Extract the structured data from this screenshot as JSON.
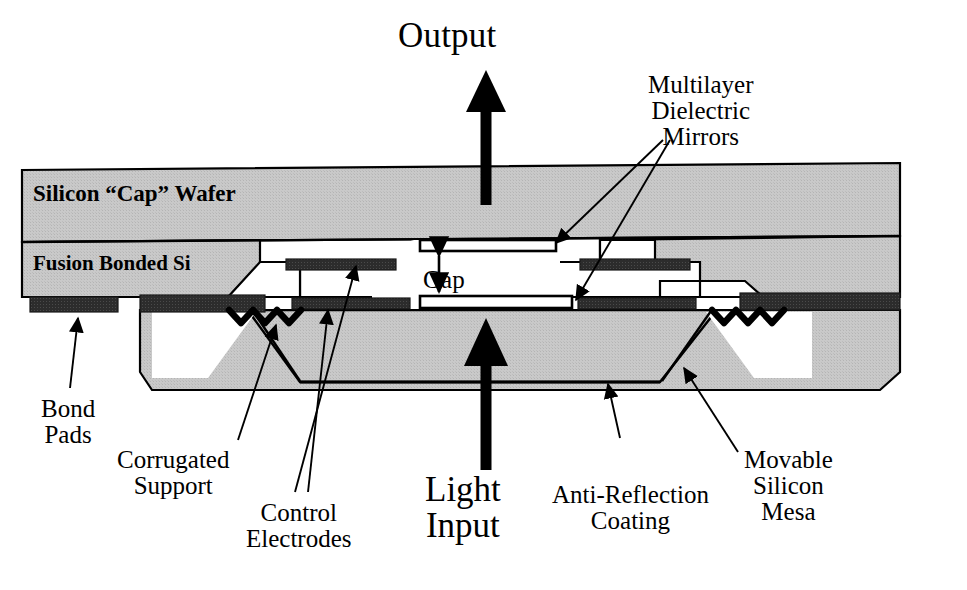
{
  "figure": {
    "type": "technical-cross-section-diagram"
  },
  "colors": {
    "background": "#ffffff",
    "silicon_fill": "#c6c6c6",
    "electrode_fill": "#2a2a2a",
    "outline": "#000000",
    "mirror_fill": "#ffffff",
    "text": "#000000"
  },
  "labels": {
    "output": "Output",
    "multilayer_dielectric_mirrors": "Multilayer\nDielectric\nMirrors",
    "silicon_cap_wafer": "Silicon “Cap” Wafer",
    "fusion_bonded_si": "Fusion Bonded Si",
    "gap": "Gap",
    "bond_pads": "Bond\nPads",
    "corrugated_support": "Corrugated\nSupport",
    "control_electrodes": "Control\nElectrodes",
    "light_input": "Light\nInput",
    "anti_reflection_coating": "Anti-Reflection\nCoating",
    "movable_silicon_mesa": "Movable\nSilicon\nMesa"
  },
  "regions": [
    {
      "name": "silicon-cap-wafer",
      "description": "Upper hatched silicon slab spanning full width"
    },
    {
      "name": "fusion-bonded-si",
      "description": "Second hatched silicon layer below cap wafer"
    },
    {
      "name": "movable-silicon-mesa",
      "description": "Central trapezoidal movable silicon mesa"
    },
    {
      "name": "bond-pads",
      "description": "Dark metal pads on the underside at the left edge"
    },
    {
      "name": "control-electrodes",
      "description": "Dark metal electrode stripes facing the actuation gap"
    },
    {
      "name": "corrugated-support",
      "description": "Zigzag corrugated flexure springs on both sides of the mesa"
    },
    {
      "name": "top-mirror",
      "description": "Upper multilayer dielectric mirror above the gap"
    },
    {
      "name": "bottom-mirror",
      "description": "Lower multilayer dielectric mirror below the gap"
    },
    {
      "name": "anti-reflection-coating",
      "description": "Coating on the lower surface of the mesa"
    }
  ],
  "arrows": [
    {
      "name": "output-beam-arrow",
      "direction": "up",
      "label": "Output"
    },
    {
      "name": "input-beam-arrow",
      "direction": "up",
      "label": "Light Input"
    },
    {
      "name": "gap-dimension-arrow",
      "direction": "both",
      "label": "Gap"
    }
  ]
}
